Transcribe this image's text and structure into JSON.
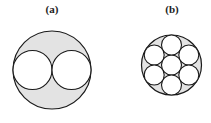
{
  "figure": {
    "panels": [
      {
        "label": "(a)",
        "label_pos": [
          52,
          13
        ],
        "outer": {
          "cx": 52,
          "cy": 70,
          "r": 39
        },
        "inner": [
          {
            "cx": 32.5,
            "cy": 70,
            "r": 19.5
          },
          {
            "cx": 71.5,
            "cy": 70,
            "r": 19.5
          }
        ]
      },
      {
        "label": "(b)",
        "label_pos": [
          172,
          13
        ],
        "outer": {
          "cx": 171.5,
          "cy": 65,
          "r": 30
        },
        "inner": [
          {
            "cx": 171.5,
            "cy": 65,
            "r": 10
          },
          {
            "cx": 171.5,
            "cy": 45,
            "r": 10
          },
          {
            "cx": 171.5,
            "cy": 85,
            "r": 10
          },
          {
            "cx": 154.2,
            "cy": 55,
            "r": 10
          },
          {
            "cx": 188.8,
            "cy": 55,
            "r": 10
          },
          {
            "cx": 154.2,
            "cy": 75,
            "r": 10
          },
          {
            "cx": 188.8,
            "cy": 75,
            "r": 10
          }
        ]
      }
    ],
    "colors": {
      "fill_outer": "#e3e3e3",
      "fill_inner": "#ffffff",
      "stroke": "#1a1a1a"
    }
  }
}
